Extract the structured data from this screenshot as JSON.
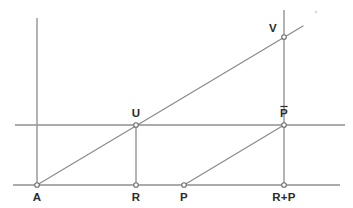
{
  "figure": {
    "canvas": {
      "width": 353,
      "height": 208
    },
    "stroke_color": "#8f8f8f",
    "label_color": "#2b2b2b",
    "background": "#ffffff"
  },
  "axes": {
    "baseline": {
      "name": "baseline",
      "y": 185,
      "x1": 13,
      "x2": 340
    },
    "midline": {
      "name": "midline",
      "y": 125,
      "x1": 15,
      "x2": 345
    }
  },
  "ordinates": [
    {
      "name": "ordinate-a",
      "x": 37,
      "y1": 18,
      "y2": 185
    },
    {
      "name": "ordinate-r",
      "x": 136,
      "y1": 125,
      "y2": 185
    },
    {
      "name": "ordinate-rp",
      "x": 284,
      "y1": 10,
      "y2": 185
    }
  ],
  "rays": [
    {
      "name": "ray-a-v",
      "x1": 37,
      "y1": 185,
      "x2": 303,
      "y2": 26
    },
    {
      "name": "ray-p-pbar",
      "x1": 184,
      "y1": 185,
      "x2": 284,
      "y2": 125
    }
  ],
  "points": [
    {
      "id": "A",
      "label": "A",
      "x": 37,
      "y": 185,
      "label_x": 37,
      "label_y": 201,
      "anchor": "middle",
      "overbar": false
    },
    {
      "id": "R",
      "label": "R",
      "x": 136,
      "y": 185,
      "label_x": 136,
      "label_y": 201,
      "anchor": "middle",
      "overbar": false
    },
    {
      "id": "P",
      "label": "P",
      "x": 184,
      "y": 185,
      "label_x": 184,
      "label_y": 201,
      "anchor": "middle",
      "overbar": false
    },
    {
      "id": "RP",
      "label": "R+P",
      "x": 284,
      "y": 185,
      "label_x": 284,
      "label_y": 201,
      "anchor": "middle",
      "overbar": false
    },
    {
      "id": "U",
      "label": "U",
      "x": 136,
      "y": 125,
      "label_x": 136,
      "label_y": 117,
      "anchor": "middle",
      "overbar": false
    },
    {
      "id": "Pbar",
      "label": "P",
      "x": 284,
      "y": 125,
      "label_x": 284,
      "label_y": 117,
      "anchor": "middle",
      "overbar": true
    },
    {
      "id": "V",
      "label": "V",
      "x": 284,
      "y": 37,
      "label_x": 273,
      "label_y": 32,
      "anchor": "middle",
      "overbar": false
    }
  ],
  "marker": {
    "radius": 2.3
  },
  "speck": {
    "name": "page-speck",
    "x": 316,
    "y": 12,
    "r": 1.3
  }
}
